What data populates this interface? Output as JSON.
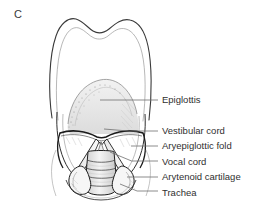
{
  "figure": {
    "panel_letter": "C",
    "caption_view": "Laryngoscopic view of the larynx",
    "background_color": "#ffffff",
    "line_color": "#1f1f1f",
    "shading_color": "#b9b9b9",
    "text_color": "#2f2f2f"
  },
  "annotations": [
    {
      "id": "epiglottis",
      "label": "Epiglottis",
      "label_x": 162,
      "label_y": 94,
      "leader_start_x": 158,
      "leader_start_y": 100,
      "leader_end_x": 100,
      "leader_end_y": 100
    },
    {
      "id": "vestibular-cord",
      "label": "Vestibular cord",
      "label_x": 162,
      "label_y": 125,
      "leader_start_x": 158,
      "leader_start_y": 131,
      "leader_end_x": 104,
      "leader_end_y": 129
    },
    {
      "id": "aryepiglottic-fold",
      "label": "Aryepiglottic fold",
      "label_x": 162,
      "label_y": 140,
      "leader_start_x": 158,
      "leader_start_y": 146,
      "leader_end_x": 131,
      "leader_end_y": 146
    },
    {
      "id": "vocal-cord",
      "label": "Vocal cord",
      "label_x": 162,
      "label_y": 156,
      "leader_start_x": 158,
      "leader_start_y": 161,
      "leader_end_x": 110,
      "leader_end_y": 152
    },
    {
      "id": "arytenoid-cartilage",
      "label": "Arytenoid cartilage",
      "label_x": 162,
      "label_y": 171,
      "leader_start_x": 158,
      "leader_start_y": 177,
      "leader_end_x": 127,
      "leader_end_y": 177
    },
    {
      "id": "trachea",
      "label": "Trachea",
      "label_x": 162,
      "label_y": 187,
      "leader_start_x": 158,
      "leader_start_y": 191,
      "leader_end_x": 120,
      "leader_end_y": 184
    }
  ]
}
